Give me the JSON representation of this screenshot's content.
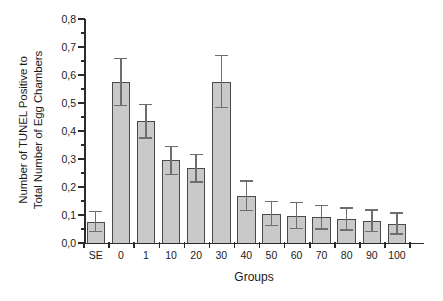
{
  "chart_data": {
    "type": "bar",
    "title": "",
    "xlabel": "Groups",
    "ylabel": "Number of TUNEL Positive to Total Number of Egg Chambers",
    "ylabel_lines": [
      "Number of TUNEL Positive to",
      "Total Number of Egg Chambers"
    ],
    "categories": [
      "SE",
      "0",
      "1",
      "10",
      "20",
      "30",
      "40",
      "50",
      "60",
      "70",
      "80",
      "90",
      "100"
    ],
    "values": [
      0.075,
      0.575,
      0.435,
      0.295,
      0.267,
      0.575,
      0.168,
      0.105,
      0.098,
      0.092,
      0.085,
      0.078,
      0.068
    ],
    "error_low": [
      0.04,
      0.492,
      0.375,
      0.245,
      0.218,
      0.485,
      0.115,
      0.062,
      0.052,
      0.05,
      0.046,
      0.04,
      0.032
    ],
    "error_high": [
      0.112,
      0.66,
      0.495,
      0.345,
      0.317,
      0.67,
      0.222,
      0.148,
      0.145,
      0.135,
      0.125,
      0.118,
      0.107
    ],
    "ylim": [
      0.0,
      0.8
    ],
    "ytick_labels": [
      "0,0",
      "0,1",
      "0,2",
      "0,3",
      "0,4",
      "0,5",
      "0,6",
      "0,7",
      "0,8"
    ],
    "ytick_values": [
      0.0,
      0.1,
      0.2,
      0.3,
      0.4,
      0.5,
      0.6,
      0.7,
      0.8
    ],
    "yminor_step": 0.05,
    "grid": false,
    "legend": null,
    "bar_color": "#c9c9c9",
    "bar_border_color": "#4a4a4a",
    "error_color": "#6e6e6e",
    "axis_color": "#2b2b2b"
  }
}
